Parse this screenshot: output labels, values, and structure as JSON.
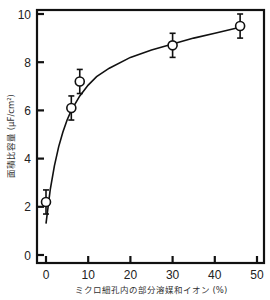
{
  "chart_data": {
    "type": "scatter",
    "title": "",
    "xlabel": "ミクロ細孔内の部分溶媒和イオン (%)",
    "ylabel": "面積比容量 (μF/cm²)",
    "xlim": [
      -2,
      51
    ],
    "ylim": [
      -0.3,
      10
    ],
    "xticks": [
      0,
      10,
      20,
      30,
      40,
      50
    ],
    "yticks": [
      0,
      2,
      4,
      6,
      8,
      10
    ],
    "grid": false,
    "legend": null,
    "series": [
      {
        "name": "measured",
        "marker": "open-circle",
        "x": [
          0,
          6,
          8,
          30,
          46
        ],
        "y": [
          2.2,
          6.1,
          7.2,
          8.7,
          9.5
        ],
        "yerr": [
          0.5,
          0.5,
          0.5,
          0.5,
          0.5
        ]
      },
      {
        "name": "fit curve",
        "style": "line",
        "x": [
          0,
          1,
          2,
          3,
          4,
          5,
          6,
          8,
          10,
          12,
          15,
          20,
          25,
          30,
          35,
          40,
          46
        ],
        "y": [
          1.3,
          2.7,
          3.7,
          4.5,
          5.1,
          5.6,
          6.0,
          6.6,
          7.05,
          7.4,
          7.75,
          8.2,
          8.5,
          8.75,
          9.0,
          9.2,
          9.45
        ]
      }
    ]
  }
}
